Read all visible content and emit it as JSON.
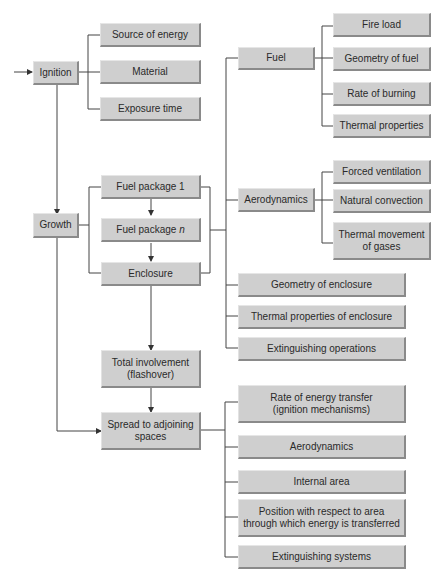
{
  "nodes": {
    "ignition": "Ignition",
    "source_of_energy": "Source of energy",
    "material": "Material",
    "exposure_time": "Exposure time",
    "fuel": "Fuel",
    "fire_load": "Fire load",
    "geometry_of_fuel": "Geometry of fuel",
    "rate_of_burning": "Rate of burning",
    "thermal_properties": "Thermal properties",
    "growth": "Growth",
    "fuel_package_1": "Fuel package 1",
    "fuel_package_n_prefix": "Fuel package ",
    "fuel_package_n_var": "n",
    "enclosure": "Enclosure",
    "aerodynamics": "Aerodynamics",
    "forced_ventilation": "Forced ventilation",
    "natural_convection": "Natural convection",
    "thermal_movement_line1": "Thermal movement",
    "thermal_movement_line2": "of gases",
    "geometry_of_enclosure": "Geometry of enclosure",
    "thermal_properties_of_enclosure": "Thermal properties of enclosure",
    "extinguishing_operations": "Extinguishing operations",
    "total_involvement_line1": "Total involvement",
    "total_involvement_line2": "(flashover)",
    "spread_line1": "Spread to adjoining",
    "spread_line2": "spaces",
    "rate_energy_line1": "Rate of energy transfer",
    "rate_energy_line2": "(ignition mechanisms)",
    "aerodynamics_2": "Aerodynamics",
    "internal_area": "Internal area",
    "position_line1": "Position with respect to area",
    "position_line2": "through which energy is transferred",
    "extinguishing_systems": "Extinguishing systems"
  },
  "colors": {
    "box_fill": "#cfcfcf",
    "box_shadow": "#8a8a8a",
    "line": "#444444"
  }
}
